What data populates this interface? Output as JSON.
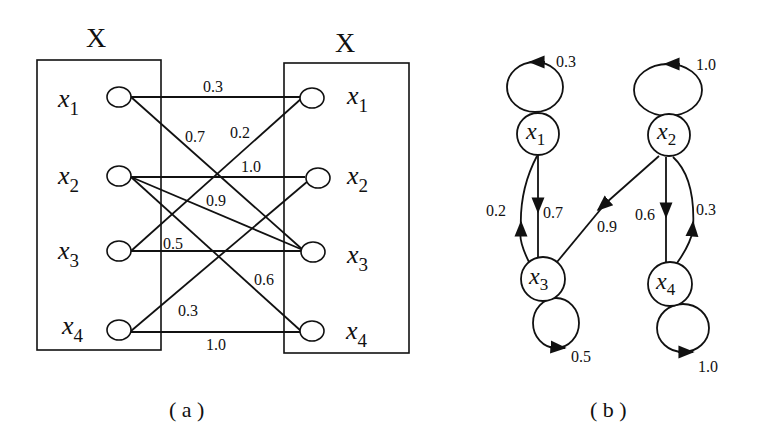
{
  "panel_a": {
    "caption": "( a )",
    "left_set_title": "X",
    "right_set_title": "X",
    "left_nodes": [
      {
        "name": "x",
        "sub": "1"
      },
      {
        "name": "x",
        "sub": "2"
      },
      {
        "name": "x",
        "sub": "3"
      },
      {
        "name": "x",
        "sub": "4"
      }
    ],
    "right_nodes": [
      {
        "name": "x",
        "sub": "1"
      },
      {
        "name": "x",
        "sub": "2"
      },
      {
        "name": "x",
        "sub": "3"
      },
      {
        "name": "x",
        "sub": "4"
      }
    ],
    "edges": [
      {
        "from": "x1",
        "to": "x1",
        "weight": "0.3"
      },
      {
        "from": "x1",
        "to": "x3",
        "weight": "0.7"
      },
      {
        "from": "x3",
        "to": "x1",
        "weight": "0.2"
      },
      {
        "from": "x2",
        "to": "x2",
        "weight": "1.0"
      },
      {
        "from": "x2",
        "to": "x3",
        "weight": "0.9"
      },
      {
        "from": "x3",
        "to": "x3",
        "weight": "0.5"
      },
      {
        "from": "x2",
        "to": "x4",
        "weight": "0.6"
      },
      {
        "from": "x4",
        "to": "x2",
        "weight": "0.3"
      },
      {
        "from": "x4",
        "to": "x4",
        "weight": "1.0"
      }
    ]
  },
  "panel_b": {
    "caption": "( b )",
    "nodes": [
      {
        "name": "x",
        "sub": "1"
      },
      {
        "name": "x",
        "sub": "2"
      },
      {
        "name": "x",
        "sub": "3"
      },
      {
        "name": "x",
        "sub": "4"
      }
    ],
    "self_loops": [
      {
        "node": "x1",
        "weight": "0.3"
      },
      {
        "node": "x2",
        "weight": "1.0"
      },
      {
        "node": "x3",
        "weight": "0.5"
      },
      {
        "node": "x4",
        "weight": "1.0"
      }
    ],
    "edges": [
      {
        "from": "x1",
        "to": "x3",
        "weight": "0.7"
      },
      {
        "from": "x3",
        "to": "x1",
        "weight": "0.2"
      },
      {
        "from": "x2",
        "to": "x3",
        "weight": "0.9"
      },
      {
        "from": "x2",
        "to": "x4",
        "weight": "0.6"
      },
      {
        "from": "x4",
        "to": "x2",
        "weight": "0.3"
      }
    ]
  }
}
